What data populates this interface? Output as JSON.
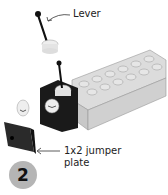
{
  "illustration": {
    "description": "LEGO building step: lever piece attaches to black 1x1 brick on a light grey 1x6 brick; 1x2 jumper plate below",
    "colors": {
      "brick_grey": "#d4d4d4",
      "brick_black": "#1a1a1a",
      "lever_white": "#eeeeee",
      "step_badge": "#b5b5b5"
    }
  },
  "labels": {
    "lever": "Lever",
    "jumper_plate_line1": "1x2 jumper",
    "jumper_plate_line2": "plate"
  },
  "step": {
    "number": "2"
  }
}
